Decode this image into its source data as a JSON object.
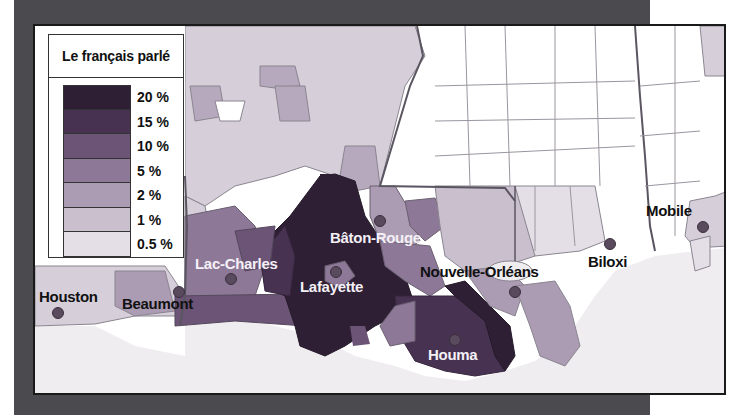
{
  "legend": {
    "title": "Le français parlé",
    "items": [
      {
        "label": "20 %",
        "color": "#2e1f35"
      },
      {
        "label": "15 %",
        "color": "#473251"
      },
      {
        "label": "10 %",
        "color": "#6b5476"
      },
      {
        "label": "5 %",
        "color": "#8d7898"
      },
      {
        "label": "2 %",
        "color": "#ab9bb3"
      },
      {
        "label": "1 %",
        "color": "#c9bfcd"
      },
      {
        "label": "0.5 %",
        "color": "#e4dfe6"
      }
    ]
  },
  "cities": [
    {
      "name": "Bâton-Rouge",
      "style": "light"
    },
    {
      "name": "Lac-Charles",
      "style": "light"
    },
    {
      "name": "Lafayette",
      "style": "light"
    },
    {
      "name": "Houston",
      "style": "dark"
    },
    {
      "name": "Beaumont",
      "style": "dark"
    },
    {
      "name": "Nouvelle-Orléans",
      "style": "dark"
    },
    {
      "name": "Biloxi",
      "style": "dark"
    },
    {
      "name": "Mobile",
      "style": "dark"
    },
    {
      "name": "Houma",
      "style": "light"
    }
  ],
  "colors": {
    "frame": "#4a4a4f",
    "water": "#efedf0",
    "outside_region": "#ffffff"
  }
}
